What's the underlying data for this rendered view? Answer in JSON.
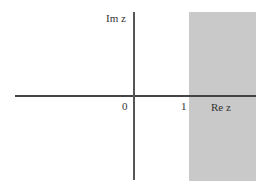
{
  "diagram": {
    "type": "complex-plane-region",
    "axes": {
      "imaginary_label": "Im z",
      "real_label": "Re z"
    },
    "ticks": {
      "origin": "0",
      "one": "1"
    },
    "region": {
      "condition": "Re z > 1",
      "fill_color": "#c9c9c9"
    },
    "axis_color": "#444444"
  }
}
